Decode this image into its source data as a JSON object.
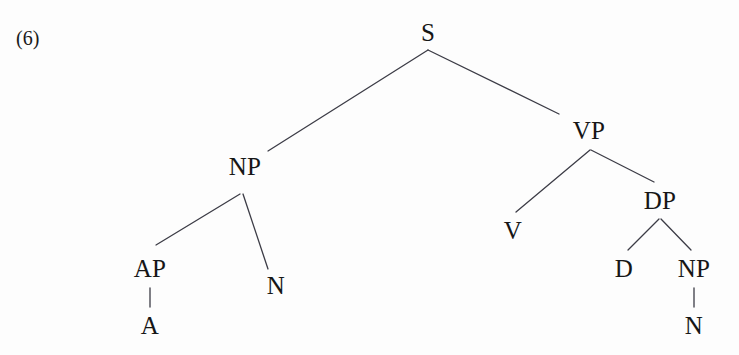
{
  "figure": {
    "example_number": "(6)",
    "example_number_x": 16,
    "example_number_y": 28,
    "canvas": {
      "width": 739,
      "height": 355
    },
    "background_color": "#fdfdfd",
    "line_color": "#3c3c46",
    "text_color": "#161616",
    "line_width": 1.3
  },
  "chart_data": {
    "type": "diagram",
    "diagram_kind": "syntax-tree",
    "title": "",
    "nodes": [
      {
        "id": "S",
        "label": "S",
        "x": 428,
        "y": 32
      },
      {
        "id": "NP1",
        "label": "NP",
        "x": 245,
        "y": 166
      },
      {
        "id": "VP",
        "label": "VP",
        "x": 589,
        "y": 130
      },
      {
        "id": "AP",
        "label": "AP",
        "x": 150,
        "y": 268
      },
      {
        "id": "N1",
        "label": "N",
        "x": 276,
        "y": 285
      },
      {
        "id": "A",
        "label": "A",
        "x": 150,
        "y": 325
      },
      {
        "id": "V",
        "label": "V",
        "x": 513,
        "y": 230
      },
      {
        "id": "DP",
        "label": "DP",
        "x": 660,
        "y": 200
      },
      {
        "id": "D",
        "label": "D",
        "x": 624,
        "y": 268
      },
      {
        "id": "NP2",
        "label": "NP",
        "x": 694,
        "y": 268
      },
      {
        "id": "N2",
        "label": "N",
        "x": 694,
        "y": 325
      }
    ],
    "edges": [
      {
        "from": "S",
        "to": "NP1",
        "x1": 428,
        "y1": 50,
        "x2": 268,
        "y2": 151
      },
      {
        "from": "S",
        "to": "VP",
        "x1": 428,
        "y1": 50,
        "x2": 559,
        "y2": 114
      },
      {
        "from": "NP1",
        "to": "AP",
        "x1": 240,
        "y1": 194,
        "x2": 156,
        "y2": 245
      },
      {
        "from": "NP1",
        "to": "N1",
        "x1": 243,
        "y1": 194,
        "x2": 268,
        "y2": 269
      },
      {
        "from": "AP",
        "to": "A",
        "x1": 150,
        "y1": 288,
        "x2": 150,
        "y2": 307
      },
      {
        "from": "VP",
        "to": "V",
        "x1": 590,
        "y1": 150,
        "x2": 516,
        "y2": 212
      },
      {
        "from": "VP",
        "to": "DP",
        "x1": 591,
        "y1": 150,
        "x2": 654,
        "y2": 182
      },
      {
        "from": "DP",
        "to": "D",
        "x1": 659,
        "y1": 219,
        "x2": 628,
        "y2": 250
      },
      {
        "from": "DP",
        "to": "NP2",
        "x1": 661,
        "y1": 219,
        "x2": 691,
        "y2": 250
      },
      {
        "from": "NP2",
        "to": "N2",
        "x1": 694,
        "y1": 288,
        "x2": 694,
        "y2": 307
      }
    ],
    "bracketing": "[S [NP [AP [A]] [N]] [VP [V] [DP [D] [NP [N]]]]]"
  }
}
